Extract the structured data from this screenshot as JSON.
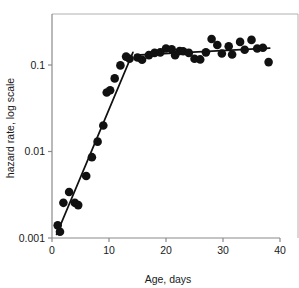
{
  "chart_data": {
    "type": "scatter",
    "title": "",
    "subtitle": "",
    "xlabel": "Age, days",
    "ylabel": "hazard rate, log scale",
    "xlim": [
      0,
      40
    ],
    "ylim": [
      0.001,
      0.3
    ],
    "yscale": "log",
    "xscale": "linear",
    "grid": false,
    "legend": "none",
    "xticks": [
      0,
      10,
      20,
      30,
      40
    ],
    "xtick_labels": [
      "0",
      "10",
      "20",
      "30",
      "40"
    ],
    "yticks": [
      0.001,
      0.01,
      0.1
    ],
    "ytick_labels": [
      "0.001",
      "0.01",
      "0.1"
    ],
    "marker": {
      "shape": "circle",
      "color": "#111111",
      "size": 4.3
    },
    "points": [
      {
        "x": 1,
        "y": 0.0014
      },
      {
        "x": 1.4,
        "y": 0.00118
      },
      {
        "x": 2,
        "y": 0.00255
      },
      {
        "x": 3,
        "y": 0.0034
      },
      {
        "x": 4,
        "y": 0.00255
      },
      {
        "x": 4.6,
        "y": 0.0024
      },
      {
        "x": 6,
        "y": 0.0052
      },
      {
        "x": 7,
        "y": 0.0086
      },
      {
        "x": 8,
        "y": 0.013
      },
      {
        "x": 9,
        "y": 0.02
      },
      {
        "x": 9.6,
        "y": 0.048
      },
      {
        "x": 10.2,
        "y": 0.051
      },
      {
        "x": 11,
        "y": 0.07
      },
      {
        "x": 12,
        "y": 0.099
      },
      {
        "x": 13,
        "y": 0.125
      },
      {
        "x": 13.6,
        "y": 0.118
      },
      {
        "x": 15,
        "y": 0.122
      },
      {
        "x": 15.8,
        "y": 0.115
      },
      {
        "x": 17,
        "y": 0.13
      },
      {
        "x": 18,
        "y": 0.138
      },
      {
        "x": 19,
        "y": 0.14
      },
      {
        "x": 20,
        "y": 0.155
      },
      {
        "x": 21,
        "y": 0.152
      },
      {
        "x": 21.6,
        "y": 0.13
      },
      {
        "x": 22.4,
        "y": 0.145
      },
      {
        "x": 23,
        "y": 0.144
      },
      {
        "x": 24,
        "y": 0.138
      },
      {
        "x": 25,
        "y": 0.118
      },
      {
        "x": 26,
        "y": 0.116
      },
      {
        "x": 27,
        "y": 0.14
      },
      {
        "x": 28,
        "y": 0.2
      },
      {
        "x": 29,
        "y": 0.17
      },
      {
        "x": 29.8,
        "y": 0.136
      },
      {
        "x": 31,
        "y": 0.165
      },
      {
        "x": 31.6,
        "y": 0.132
      },
      {
        "x": 33,
        "y": 0.185
      },
      {
        "x": 33.8,
        "y": 0.15
      },
      {
        "x": 35,
        "y": 0.195
      },
      {
        "x": 36,
        "y": 0.155
      },
      {
        "x": 37,
        "y": 0.158
      },
      {
        "x": 38,
        "y": 0.108
      }
    ],
    "fit_lines": [
      {
        "name": "rising-segment",
        "x": [
          0.8,
          14.2
        ],
        "y": [
          0.0011,
          0.14
        ]
      },
      {
        "name": "plateau-segment",
        "x": [
          14.6,
          38.2
        ],
        "y": [
          0.13,
          0.157
        ]
      }
    ],
    "line_color": "#111111"
  },
  "axis": {
    "frame_color": "#b0b0b0",
    "axis_color": "#6e6e6e"
  }
}
